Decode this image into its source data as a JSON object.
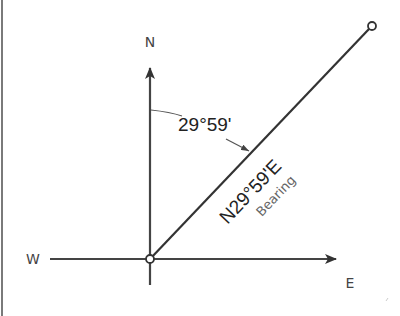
{
  "diagram": {
    "type": "compass-bearing",
    "directions": {
      "north": "N",
      "west": "W",
      "east": "E"
    },
    "angle_label": "29°59'",
    "bearing_value": "N29°59'E",
    "bearing_caption": "Bearing",
    "bearing_angle_degrees_from_north": 29.98,
    "colors": {
      "line": "#333333",
      "label": "#444444",
      "caption": "#666666",
      "border": "#7a7a7a"
    }
  }
}
